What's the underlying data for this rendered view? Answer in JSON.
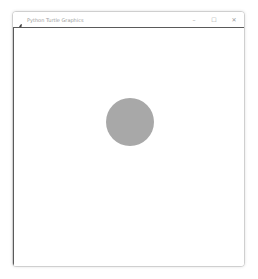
{
  "window": {
    "title": "Python Turtle Graphics",
    "app_icon": "feather-icon",
    "controls": {
      "minimize": "–",
      "maximize": "☐",
      "close": "✕"
    }
  },
  "canvas": {
    "shapes": [
      {
        "type": "circle",
        "fill": "#a8a8a8"
      }
    ]
  }
}
